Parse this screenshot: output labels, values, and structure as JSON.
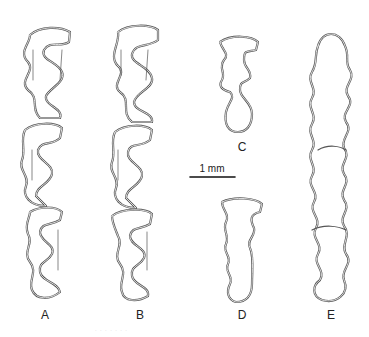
{
  "figure": {
    "type": "scientific-illustration",
    "stroke_color": "#555555",
    "background": "#ffffff",
    "specimens": [
      {
        "label": "A",
        "x": 45,
        "top": 28,
        "bottom": 298
      },
      {
        "label": "B",
        "x": 140,
        "top": 28,
        "bottom": 298
      },
      {
        "label": "C",
        "x": 240,
        "top": 38,
        "bottom": 135
      },
      {
        "label": "D",
        "x": 242,
        "top": 198,
        "bottom": 300
      },
      {
        "label": "E",
        "x": 330,
        "top": 33,
        "bottom": 303
      }
    ],
    "scale_bar": {
      "label": "1 mm",
      "x1": 190,
      "x2": 235,
      "y": 177
    },
    "caption_fragment": "· · · · · · ·"
  }
}
